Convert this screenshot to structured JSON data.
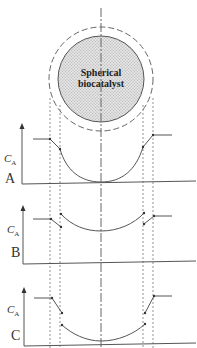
{
  "diagram": {
    "particle_label_line1": "Spherical",
    "particle_label_line2": "biocatalyst",
    "colors": {
      "line": "#555555",
      "particle_fill": "#d9d9d9",
      "background": "#ffffff"
    },
    "panels": [
      {
        "id": "A",
        "label": "A",
        "axis_label": "C",
        "axis_sub": "A",
        "description": "Concentration profile with continuous decline through boundary layer and within particle"
      },
      {
        "id": "B",
        "label": "B",
        "axis_label": "C",
        "axis_sub": "A",
        "description": "Concentration profile with partition discontinuities at boundaries"
      },
      {
        "id": "C",
        "label": "C",
        "axis_label": "C",
        "axis_sub": "A",
        "description": "Concentration profile with film drop and partition discontinuities"
      }
    ]
  }
}
